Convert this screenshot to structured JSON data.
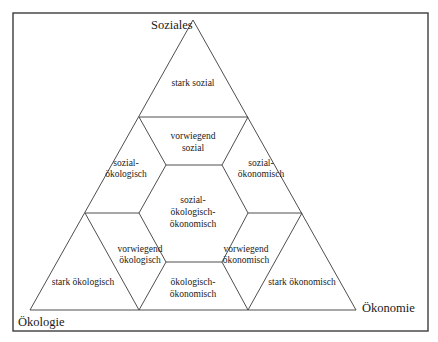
{
  "diagram": {
    "corners": {
      "top": "Soziales",
      "bottom_left": "Ökologie",
      "bottom_right": "Ökonomie"
    },
    "regions": {
      "stark_sozial": [
        "stark sozial"
      ],
      "vorwiegend_sozial": [
        "vorwiegend",
        "sozial"
      ],
      "sozial_oekologisch": [
        "sozial-",
        "ökologisch"
      ],
      "sozial_oekonomisch": [
        "sozial-",
        "ökonomisch"
      ],
      "zentrum": [
        "sozial-",
        "ökologisch-",
        "ökonomisch"
      ],
      "vorwiegend_oekologisch": [
        "vorwiegend",
        "ökologisch"
      ],
      "vorwiegend_oekonomisch": [
        "vorwiegend",
        "ökonomisch"
      ],
      "stark_oekologisch": [
        "stark ökologisch"
      ],
      "oekologisch_oekonomisch": [
        "ökologisch-",
        "ökonomisch"
      ],
      "stark_oekonomisch": [
        "stark ökonomisch"
      ]
    }
  }
}
